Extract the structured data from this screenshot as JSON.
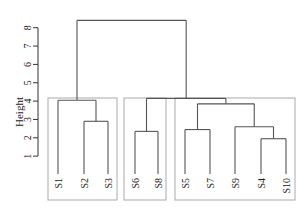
{
  "chart_data": {
    "type": "dendrogram",
    "title": "",
    "xlabel": "",
    "ylabel": "Height",
    "ylim": [
      0,
      8.5
    ],
    "y_ticks": [
      1,
      2,
      3,
      4,
      5,
      6,
      7,
      8
    ],
    "leaves": [
      "S1",
      "S2",
      "S3",
      "S6",
      "S8",
      "S5",
      "S7",
      "S9",
      "S4",
      "S10"
    ],
    "merges": [
      {
        "left": "S4",
        "right": "S10",
        "height": 1.95
      },
      {
        "left": "S6",
        "right": "S8",
        "height": 2.35
      },
      {
        "left": "S5",
        "right": "S7",
        "height": 2.45
      },
      {
        "left": "S9",
        "right": "(S4,S10)",
        "height": 2.6
      },
      {
        "left": "S2",
        "right": "S3",
        "height": 2.9
      },
      {
        "left": "(S5,S7)",
        "right": "(S9,S4,S10)",
        "height": 3.85
      },
      {
        "left": "S1",
        "right": "(S2,S3)",
        "height": 4.05
      },
      {
        "left": "(S6,S8)",
        "right": "(S5,S7,S9,S4,S10)",
        "height": 4.15
      },
      {
        "left": "(S1,S2,S3)",
        "right": "(S6,S8,S5,S7,S9,S4,S10)",
        "height": 8.4
      }
    ],
    "cluster_boxes": [
      {
        "members": [
          "S1",
          "S2",
          "S3"
        ]
      },
      {
        "members": [
          "S6",
          "S8"
        ]
      },
      {
        "members": [
          "S5",
          "S7",
          "S9",
          "S4",
          "S10"
        ]
      }
    ],
    "grid": false,
    "line_color": "#555555",
    "box_color": "#aaaaaa"
  }
}
